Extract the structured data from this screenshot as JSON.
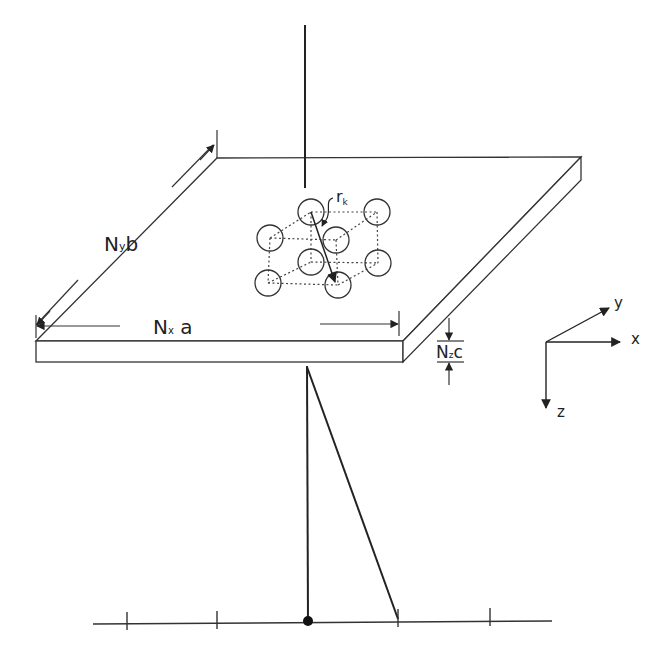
{
  "diagram": {
    "type": "physics-schematic",
    "colors": {
      "stroke": "#222222",
      "dotted": "#444444",
      "background": "#ffffff"
    },
    "labels": {
      "ny_b": {
        "main": "N",
        "sub": "y",
        "tail": "b"
      },
      "nx_a": {
        "main": "N",
        "sub": "x",
        "tail": " a"
      },
      "nz_c": {
        "main": "N",
        "sub": "z",
        "tail": "c"
      },
      "r_k": {
        "main": "r",
        "sub": "k"
      }
    },
    "axes": {
      "x": "x",
      "y": "y",
      "z": "z"
    },
    "detector": {
      "tick_count": 5,
      "has_center_dot": true
    },
    "unit_cell": {
      "atom_count": 8
    }
  }
}
